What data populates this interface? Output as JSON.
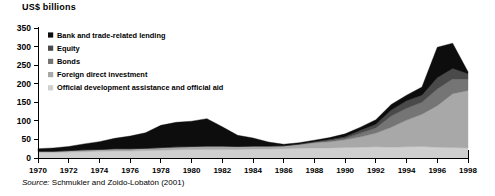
{
  "figure": {
    "axis_title": "US$ billions",
    "source_prefix": "Source:",
    "source_text": " Schmukler and Zoido-Lobatón (2001)"
  },
  "legend": {
    "items": [
      {
        "label": "Bank and trade-related lending",
        "color": "#0d0d0d"
      },
      {
        "label": "Equity",
        "color": "#4a4a4a"
      },
      {
        "label": "Bonds",
        "color": "#757575"
      },
      {
        "label": "Foreign direct investment",
        "color": "#a8a8a8"
      },
      {
        "label": "Official development assistance and official aid",
        "color": "#cfcfcf"
      }
    ]
  },
  "chart_data": {
    "type": "area",
    "title": "US$ billions",
    "xlabel": "",
    "ylabel": "US$ billions",
    "ylim": [
      0,
      350
    ],
    "yticks": [
      0,
      50,
      100,
      150,
      200,
      250,
      300,
      350
    ],
    "xlim": [
      1970,
      1998
    ],
    "xticks": [
      1970,
      1972,
      1974,
      1976,
      1978,
      1980,
      1982,
      1984,
      1986,
      1988,
      1990,
      1992,
      1994,
      1996,
      1998
    ],
    "tick_labels": [
      "1970",
      "1972",
      "1974",
      "1976",
      "1978",
      "1980",
      "1982",
      "1984",
      "1986",
      "1988",
      "1990",
      "1992",
      "1994",
      "1996",
      "1998"
    ],
    "grid": false,
    "legend_position": "inside-top-left",
    "stacked": true,
    "stack_order_bottom_to_top": [
      "Official development assistance and official aid",
      "Foreign direct investment",
      "Bonds",
      "Equity",
      "Bank and trade-related lending"
    ],
    "x": [
      1970,
      1971,
      1972,
      1973,
      1974,
      1975,
      1976,
      1977,
      1978,
      1979,
      1980,
      1981,
      1982,
      1983,
      1984,
      1985,
      1986,
      1987,
      1988,
      1989,
      1990,
      1991,
      1992,
      1993,
      1994,
      1995,
      1996,
      1997,
      1998
    ],
    "series": [
      {
        "name": "Official development assistance and official aid",
        "color": "#cfcfcf",
        "values": [
          15,
          15,
          16,
          17,
          18,
          19,
          19,
          20,
          21,
          22,
          23,
          23,
          23,
          23,
          24,
          24,
          25,
          26,
          27,
          27,
          28,
          29,
          30,
          29,
          30,
          31,
          29,
          28,
          27
        ]
      },
      {
        "name": "Foreign direct investment",
        "color": "#a8a8a8",
        "values": [
          3,
          3,
          4,
          5,
          5,
          6,
          6,
          6,
          7,
          8,
          8,
          9,
          9,
          8,
          8,
          8,
          8,
          10,
          14,
          17,
          21,
          28,
          37,
          54,
          72,
          87,
          112,
          145,
          155
        ]
      },
      {
        "name": "Bonds",
        "color": "#757575"
      },
      {
        "name": "Equity",
        "color": "#4a4a4a"
      },
      {
        "name": "Bank and trade-related lending",
        "color": "#0d0d0d"
      }
    ],
    "series_bonds_values": [
      0,
      0,
      0,
      0,
      0,
      0,
      0,
      0,
      0,
      0,
      0,
      0,
      0,
      0,
      0,
      0,
      0,
      1,
      2,
      3,
      4,
      10,
      14,
      30,
      32,
      32,
      45,
      40,
      30
    ],
    "series_equity_values": [
      0,
      0,
      0,
      0,
      0,
      0,
      0,
      0,
      0,
      0,
      0,
      0,
      0,
      0,
      0,
      0,
      0,
      1,
      1,
      3,
      4,
      8,
      10,
      16,
      20,
      19,
      30,
      28,
      15
    ],
    "series_bank_values": [
      7,
      9,
      11,
      16,
      21,
      28,
      34,
      42,
      60,
      66,
      68,
      74,
      52,
      30,
      22,
      11,
      4,
      3,
      4,
      5,
      8,
      8,
      12,
      15,
      15,
      22,
      82,
      68,
      5
    ],
    "totals": [
      25,
      27,
      31,
      38,
      44,
      53,
      59,
      68,
      88,
      96,
      99,
      106,
      84,
      61,
      54,
      43,
      37,
      41,
      48,
      55,
      65,
      83,
      103,
      144,
      169,
      191,
      298,
      309,
      232
    ]
  }
}
